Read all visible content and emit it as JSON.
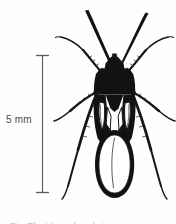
{
  "figure": {
    "kind": "scientific-line-illustration",
    "background_color": "#fefefe",
    "ink_color": "#111111",
    "caption_text": "Fig. Plant bug, dorsal view",
    "caption_color": "#b9b9b9"
  },
  "scale_bar": {
    "label": "5 mm",
    "value": 5,
    "unit": "mm",
    "orientation": "vertical",
    "text_color": "#4a4a4a",
    "line_color": "#5a5a5a",
    "top_y": 55,
    "bottom_y": 193,
    "x": 42
  },
  "specimen": {
    "parts": [
      {
        "name": "antenna-left",
        "label": "antenna"
      },
      {
        "name": "antenna-right",
        "label": "antenna"
      },
      {
        "name": "head",
        "label": "head"
      },
      {
        "name": "pronotum",
        "label": "pronotum"
      },
      {
        "name": "scutellum",
        "label": "scutellum"
      },
      {
        "name": "hemelytron-left",
        "label": "hemelytron"
      },
      {
        "name": "hemelytron-right",
        "label": "hemelytron"
      },
      {
        "name": "cuneus-left",
        "label": "cuneus"
      },
      {
        "name": "cuneus-right",
        "label": "cuneus"
      },
      {
        "name": "membrane",
        "label": "membrane"
      },
      {
        "name": "foreleg-left",
        "label": "foreleg"
      },
      {
        "name": "foreleg-right",
        "label": "foreleg"
      },
      {
        "name": "midleg-left",
        "label": "midleg"
      },
      {
        "name": "midleg-right",
        "label": "midleg"
      },
      {
        "name": "hindleg-left",
        "label": "hindleg"
      },
      {
        "name": "hindleg-right",
        "label": "hindleg"
      }
    ]
  }
}
